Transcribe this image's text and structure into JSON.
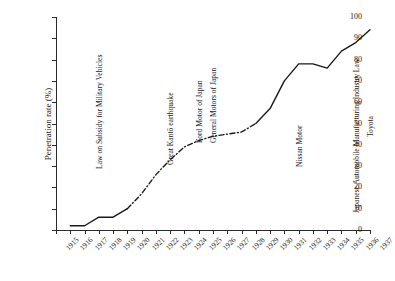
{
  "chart_data": {
    "type": "line",
    "title": "",
    "xlabel": "",
    "ylabel": "Penetration rate (%)",
    "xlim": [
      1915,
      1937
    ],
    "ylim": [
      0,
      100
    ],
    "grid": false,
    "legend": "none",
    "y_ticks": [
      0,
      10,
      20,
      30,
      40,
      50,
      60,
      70,
      80,
      90,
      100
    ],
    "x_ticks": [
      1915,
      1916,
      1917,
      1918,
      1919,
      1920,
      1921,
      1922,
      1923,
      1924,
      1925,
      1926,
      1927,
      1928,
      1929,
      1930,
      1931,
      1932,
      1933,
      1934,
      1935,
      1936,
      1937
    ],
    "series": [
      {
        "name": "Penetration rate",
        "x": [
          1916,
          1917,
          1918,
          1919,
          1920,
          1921,
          1922,
          1923,
          1924,
          1925,
          1926,
          1927,
          1928,
          1929,
          1930,
          1931,
          1932,
          1933,
          1934,
          1935,
          1936,
          1937
        ],
        "values": [
          2,
          2,
          6,
          6,
          10,
          17,
          26,
          33,
          39,
          42,
          44,
          45,
          46,
          50,
          57,
          70,
          78,
          78,
          76,
          84,
          88,
          94
        ],
        "line_style_segments": [
          {
            "from": 1916,
            "to": 1920,
            "style": "solid"
          },
          {
            "from": 1920,
            "to": 1929,
            "style": "dashdot"
          },
          {
            "from": 1929,
            "to": 1937,
            "style": "solid"
          }
        ],
        "color": "#1a1a1a"
      }
    ],
    "annotations": [
      {
        "label": "Law on Subsidy for Military Vehicles",
        "year": 1918,
        "rotation": -90
      },
      {
        "label": "Great Kantō earthquake",
        "year": 1923,
        "rotation": -90
      },
      {
        "label": "Ford Motor of Japan",
        "year": 1925,
        "rotation": -90
      },
      {
        "label": "General Motors of Japan",
        "year": 1926,
        "rotation": -90
      },
      {
        "label": "Nissan Motor",
        "year": 1932,
        "rotation": -90
      },
      {
        "label": "Japanese Automobile Manufacturing Industry Law",
        "year": 1936,
        "rotation": -90
      },
      {
        "label": "Toyota",
        "year": 1937,
        "rotation": -90
      }
    ]
  },
  "axes": {
    "y_title": "Penetration rate (%)"
  }
}
